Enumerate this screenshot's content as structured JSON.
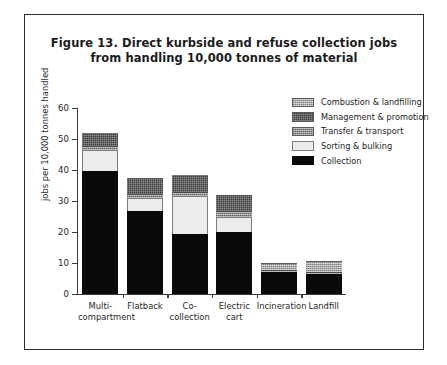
{
  "figure": {
    "title_line1": "Figure 13. Direct kurbside and refuse collection jobs",
    "title_line2": "from handling 10,000 tonnes of material"
  },
  "chart_data": {
    "type": "bar",
    "stacked": true,
    "title": "Figure 13. Direct kurbside and refuse collection jobs from handling 10,000 tonnes of material",
    "xlabel": "",
    "ylabel": "jobs per 10,000 tonnes handled",
    "ylim": [
      0,
      60
    ],
    "yticks": [
      0,
      10,
      20,
      30,
      40,
      50,
      60
    ],
    "ytick_labels": [
      "0",
      "10",
      "20",
      "30",
      "40",
      "50",
      "60"
    ],
    "grid": false,
    "legend_position": "top-right",
    "categories": [
      "Multi-compartment",
      "Flatback",
      "Co-collection",
      "Electric cart",
      "Incineration",
      "Landfill"
    ],
    "category_label_lines": [
      [
        "Multi-",
        "compartment"
      ],
      [
        "Flatback"
      ],
      [
        "Co-collection"
      ],
      [
        "Electric",
        "cart"
      ],
      [
        "Incineration"
      ],
      [
        "Landfill"
      ]
    ],
    "series": [
      {
        "name": "Collection",
        "color": "#0a0a0a",
        "values": [
          39.8,
          26.8,
          19.2,
          19.9,
          7.0,
          6.5
        ]
      },
      {
        "name": "Sorting & bulking",
        "color": "#ececec",
        "values": [
          6.6,
          4.2,
          12.3,
          5.1,
          0.0,
          0.0
        ]
      },
      {
        "name": "Transfer & transport",
        "color": "#8d8d8d",
        "values": [
          1.5,
          1.4,
          1.5,
          1.8,
          0.8,
          0.7
        ]
      },
      {
        "name": "Management & promotion",
        "color": "#3d3d3d",
        "values": [
          4.1,
          5.1,
          5.5,
          5.2,
          0.0,
          0.0
        ]
      },
      {
        "name": "Combustion & landfilling",
        "color": "#a8a8a8",
        "values": [
          0.0,
          0.0,
          0.0,
          0.0,
          2.2,
          3.6
        ]
      }
    ],
    "totals": [
      52.0,
      37.5,
      38.5,
      32.0,
      10.0,
      10.8
    ]
  },
  "legend": {
    "entries": [
      {
        "label": "Combustion & landfilling",
        "swatch": "s-combustion"
      },
      {
        "label": "Management & promotion",
        "swatch": "s-mgmt"
      },
      {
        "label": "Transfer & transport",
        "swatch": "s-transfer"
      },
      {
        "label": "Sorting & bulking",
        "swatch": "s-sorting"
      },
      {
        "label": "Collection",
        "swatch": "s-collection"
      }
    ]
  }
}
